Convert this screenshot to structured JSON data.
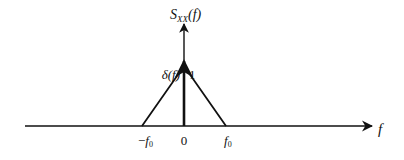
{
  "diagram": {
    "y_axis": {
      "label_main": "S",
      "label_sub": "XX",
      "label_arg": "(f)"
    },
    "x_axis": {
      "label": "f"
    },
    "impulse": {
      "label": "δ(f)",
      "weight": "1"
    },
    "ticks": {
      "neg_f0_sign": "−",
      "neg_f0_var": "f",
      "neg_f0_sub": "0",
      "zero": "0",
      "pos_f0_var": "f",
      "pos_f0_sub": "0"
    },
    "colors": {
      "line": "#111111",
      "background": "#ffffff"
    }
  }
}
